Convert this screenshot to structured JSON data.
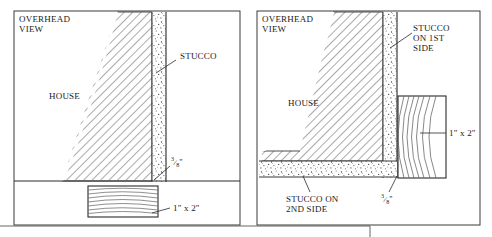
{
  "figure": {
    "title_hidden": "",
    "type": "technical-line-drawing",
    "panels": [
      {
        "id": "left",
        "name": "overhead-view-first-side",
        "view_label_line1": "OVERHEAD",
        "view_label_line2": "VIEW",
        "house_label": "HOUSE",
        "labels": [
          {
            "name": "stucco-label",
            "text": "STUCCO"
          },
          {
            "name": "gap-dimension-label",
            "numerator": "3",
            "denominator": "8",
            "unit": "\""
          },
          {
            "name": "board-size-label",
            "text": "1\" x 2\""
          }
        ]
      },
      {
        "id": "right",
        "name": "overhead-view-second-side",
        "view_label_line1": "OVERHEAD",
        "view_label_line2": "VIEW",
        "house_label": "HOUSE",
        "labels": [
          {
            "name": "stucco-first-side-label",
            "line1": "STUCCO",
            "line2": "ON 1ST",
            "line3": "SIDE"
          },
          {
            "name": "stucco-second-side-label",
            "line1": "STUCCO ON",
            "line2": "2ND SIDE"
          },
          {
            "name": "board-size-label",
            "text": "1\" x 2\""
          },
          {
            "name": "gap-dimension-label",
            "numerator": "3",
            "denominator": "8",
            "unit": "\""
          }
        ]
      }
    ],
    "colors": {
      "ink": "#1a1a1a",
      "frame": "#3a3a3a",
      "hatch": "#555555",
      "stipple": "#4a4a4a",
      "paper": "#ffffff"
    }
  }
}
